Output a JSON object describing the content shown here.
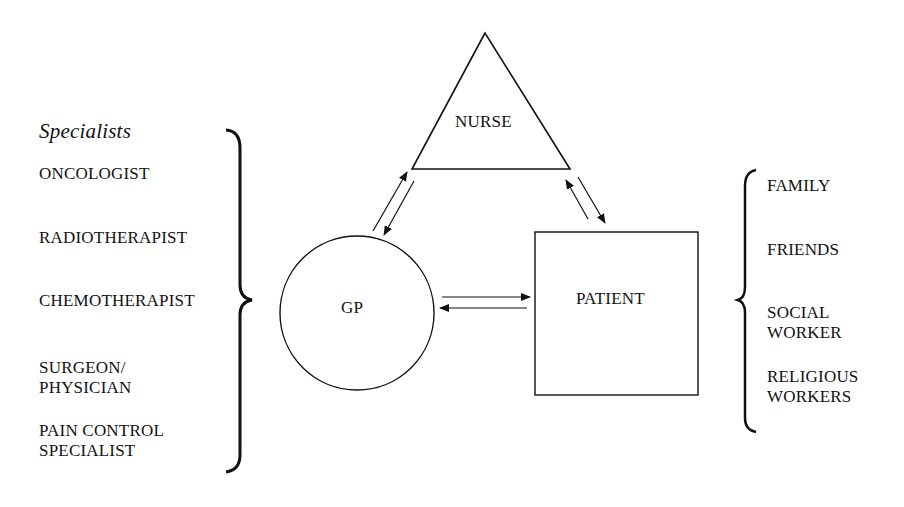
{
  "specialists": {
    "title": "Specialists",
    "items": [
      "ONCOLOGIST",
      "RADIOTHERAPIST",
      "CHEMOTHERAPIST",
      "SURGEON/\nPHYSICIAN",
      "PAIN CONTROL\nSPECIALIST"
    ]
  },
  "nodes": {
    "nurse": "NURSE",
    "gp": "GP",
    "patient": "PATIENT"
  },
  "support": {
    "items": [
      "FAMILY",
      "FRIENDS",
      "SOCIAL\nWORKER",
      "RELIGIOUS\nWORKERS"
    ]
  },
  "colors": {
    "ink": "#111111",
    "background": "#ffffff"
  }
}
